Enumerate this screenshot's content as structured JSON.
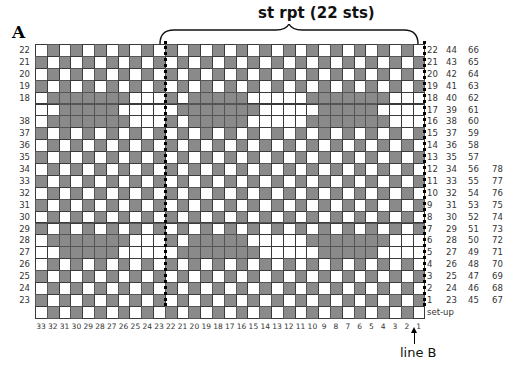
{
  "chart_label": "A",
  "repeat_title": "st rpt (22 sts)",
  "setup_label": "set-up",
  "line_marker": "line B",
  "left_row_labels": [
    "22",
    "21",
    "20",
    "19",
    "18",
    "",
    "38",
    "37",
    "36",
    "35",
    "34",
    "33",
    "32",
    "31",
    "30",
    "29",
    "28",
    "27",
    "26",
    "25",
    "24",
    "23",
    ""
  ],
  "right_row_labels": [
    [
      "22",
      "44",
      "66",
      ""
    ],
    [
      "21",
      "43",
      "65",
      ""
    ],
    [
      "20",
      "42",
      "64",
      ""
    ],
    [
      "19",
      "41",
      "63",
      ""
    ],
    [
      "18",
      "40",
      "62",
      ""
    ],
    [
      "17",
      "39",
      "61",
      ""
    ],
    [
      "16",
      "38",
      "60",
      ""
    ],
    [
      "15",
      "37",
      "59",
      ""
    ],
    [
      "14",
      "36",
      "58",
      ""
    ],
    [
      "13",
      "35",
      "57",
      ""
    ],
    [
      "12",
      "34",
      "56",
      "78"
    ],
    [
      "11",
      "33",
      "55",
      "77"
    ],
    [
      "10",
      "32",
      "54",
      "76"
    ],
    [
      "9",
      "31",
      "53",
      "75"
    ],
    [
      "8",
      "30",
      "52",
      "74"
    ],
    [
      "7",
      "29",
      "51",
      "73"
    ],
    [
      "6",
      "28",
      "50",
      "72"
    ],
    [
      "5",
      "27",
      "49",
      "71"
    ],
    [
      "4",
      "26",
      "48",
      "70"
    ],
    [
      "3",
      "25",
      "47",
      "69"
    ],
    [
      "2",
      "24",
      "46",
      "68"
    ],
    [
      "1",
      "23",
      "45",
      "67"
    ],
    [
      "set-up",
      "",
      "",
      ""
    ]
  ],
  "column_labels": [
    "33",
    "32",
    "31",
    "30",
    "29",
    "28",
    "27",
    "26",
    "25",
    "24",
    "23",
    "22",
    "21",
    "20",
    "19",
    "18",
    "17",
    "16",
    "15",
    "14",
    "13",
    "12",
    "11",
    "10",
    "9",
    "8",
    "7",
    "6",
    "5",
    "4",
    "3",
    "2",
    "1"
  ],
  "grid": {
    "columns": 33,
    "rows": 23,
    "repeat_start_col": 11,
    "repeat_width": 22
  },
  "colors": {
    "filled": "#8a8a8a",
    "empty": "#ffffff",
    "grid_line": "#3a3a3a"
  }
}
